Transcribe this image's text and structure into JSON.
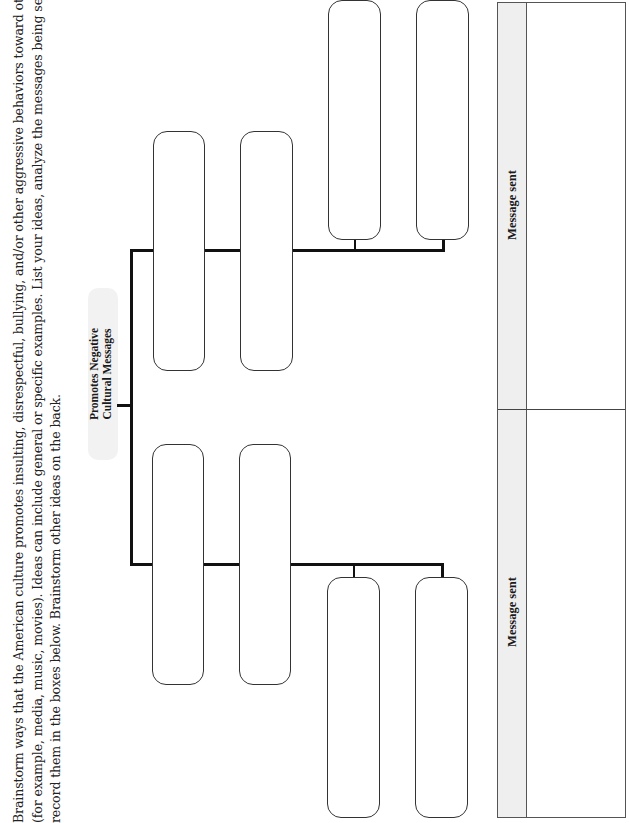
{
  "instructions": {
    "lines": [
      "Brainstorm ways that the American culture promotes insulting, disrespectful, bullying, and/or other aggressive behaviors toward others",
      "(for example, media, music, movies). Ideas can include general or specific examples. List your ideas, analyze the messages being sent, and",
      "record them in the boxes below. Brainstorm other ideas on the back."
    ]
  },
  "diagram": {
    "central_node": {
      "line1": "Promotes Negative",
      "line2": "Cultural Messages",
      "fill": "#f2f2f2"
    },
    "branches": [
      {
        "name": "upper",
        "boxes": 4
      },
      {
        "name": "lower",
        "boxes": 4
      }
    ]
  },
  "table": {
    "sections": [
      {
        "header": "Message sent",
        "content": ""
      },
      {
        "header": "Message sent",
        "content": ""
      }
    ],
    "header_fill": "#efefef"
  }
}
